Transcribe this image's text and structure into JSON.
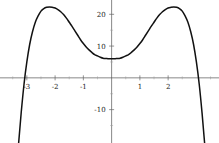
{
  "chart_data": {
    "type": "line",
    "title": "",
    "subtitle": "",
    "xlabel": "",
    "ylabel": "",
    "xlim": [
      -3.95,
      3.8
    ],
    "ylim": [
      -20.5,
      24.5
    ],
    "grid": false,
    "legend": null,
    "background_color": "#ffffff",
    "curve_color": "#111111",
    "axis_color": "#555555",
    "x_ticks": [
      -3,
      -2,
      -1,
      1,
      2
    ],
    "x_tick_labels": [
      "-3",
      "-2",
      "-1",
      "1",
      "2"
    ],
    "y_ticks": [
      20,
      10,
      -10
    ],
    "y_tick_labels": [
      "20",
      "10",
      "-10"
    ],
    "x_minor_ticks": [
      -3.5,
      -2.5,
      -1.5,
      -0.5,
      0.5,
      1.5,
      2.5,
      3.5
    ],
    "y_minor_ticks": [
      25,
      15,
      5,
      -5,
      -15
    ],
    "series": [
      {
        "name": "f(x)",
        "description": "even-degree polynomial, negative leading coefficient, W-shaped with two maxima",
        "x": [
          -3.6,
          -3.5,
          -3.4,
          -3.3,
          -3.2,
          -3.1,
          -3.0,
          -2.9,
          -2.8,
          -2.7,
          -2.6,
          -2.5,
          -2.4,
          -2.3,
          -2.2,
          -2.1,
          -2.0,
          -1.9,
          -1.8,
          -1.7,
          -1.6,
          -1.5,
          -1.4,
          -1.3,
          -1.2,
          -1.1,
          -1.0,
          -0.9,
          -0.8,
          -0.7,
          -0.6,
          -0.5,
          -0.4,
          -0.3,
          -0.2,
          -0.1,
          0.0,
          0.1,
          0.2,
          0.3,
          0.4,
          0.5,
          0.6,
          0.7,
          0.8,
          0.9,
          1.0,
          1.1,
          1.2,
          1.3,
          1.4,
          1.5,
          1.6,
          1.7,
          1.8,
          1.9,
          2.0,
          2.1,
          2.2,
          2.3,
          2.4,
          2.5,
          2.6,
          2.7,
          2.8,
          2.9,
          3.0,
          3.1,
          3.2,
          3.3,
          3.4,
          3.5,
          3.6
        ],
        "y": [
          -64.0,
          -48.0,
          -34.0,
          -21.5,
          -11.0,
          -2.0,
          5.0,
          10.5,
          14.5,
          17.5,
          19.5,
          21.0,
          21.8,
          22.2,
          22.3,
          22.2,
          22.0,
          21.5,
          20.8,
          19.9,
          18.8,
          17.5,
          16.2,
          14.8,
          13.4,
          12.0,
          10.8,
          9.7,
          8.8,
          8.0,
          7.3,
          6.9,
          6.5,
          6.2,
          6.1,
          6.0,
          6.0,
          6.0,
          6.1,
          6.2,
          6.5,
          6.9,
          7.3,
          8.0,
          8.8,
          9.7,
          10.8,
          12.0,
          13.4,
          14.8,
          16.2,
          17.5,
          18.8,
          19.9,
          20.8,
          21.5,
          22.0,
          22.2,
          22.3,
          22.2,
          21.8,
          21.0,
          19.5,
          17.5,
          14.5,
          10.5,
          5.0,
          -2.0,
          -11.0,
          -21.5,
          -34.0,
          -48.0,
          -64.0
        ],
        "key_points": {
          "local_minimum": {
            "x": 0,
            "y": 6
          },
          "left_maximum": {
            "x": -2.2,
            "y": 22.3
          },
          "right_maximum": {
            "x": 2.2,
            "y": 22.3
          },
          "left_root": {
            "x": -3.07,
            "y": 0
          },
          "right_root": {
            "x": 3.07,
            "y": 0
          }
        }
      }
    ]
  }
}
